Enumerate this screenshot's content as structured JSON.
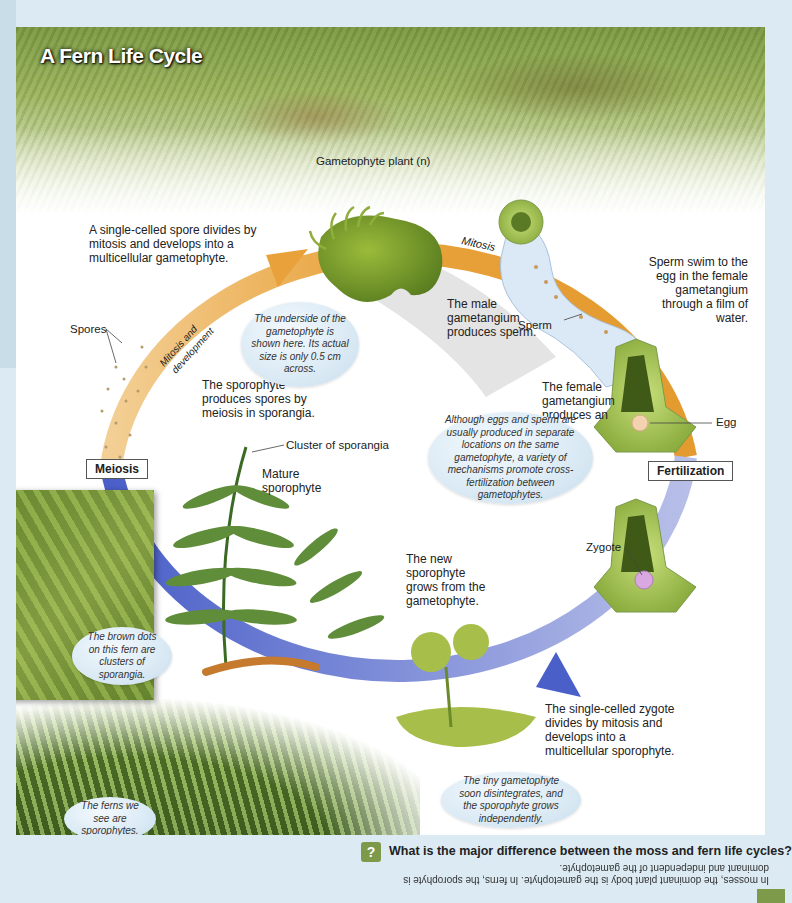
{
  "title": "A Fern Life Cycle",
  "stages": {
    "meiosis": "Meiosis",
    "fertilization": "Fertilization"
  },
  "arrows": {
    "mitosis_dev_top": "Mitosis and development",
    "mitosis": "Mitosis",
    "mitosis_dev_bottom": "Mitosis and development"
  },
  "labels": {
    "gametophyte_plant": "Gametophyte plant (n)",
    "spores": "Spores",
    "sperm": "Sperm",
    "egg": "Egg",
    "zygote": "Zygote",
    "cluster_sporangia": "Cluster of sporangia",
    "mature_sporophyte": "Mature sporophyte"
  },
  "descriptions": {
    "spore_divides": "A single-celled spore divides by mitosis and develops into a multicellular gametophyte.",
    "male_gametangium": "The male gametangium produces sperm.",
    "sperm_swim": "Sperm swim to the egg in the female gametangium through a film of water.",
    "female_gametangium": "The female gametangium produces an egg.",
    "sporophyte_produces": "The sporophyte produces spores by meiosis in sporangia.",
    "new_sporophyte": "The new sporophyte grows from the gametophyte.",
    "zygote_divides": "The single-celled zygote divides by mitosis and develops into a multicellular sporophyte."
  },
  "bubbles": {
    "underside": "The underside of the gametophyte is shown here. Its actual size is only 0.5 cm across.",
    "cross_fertilization": "Although eggs and sperm are usually produced in separate locations on the same gametophyte, a variety of mechanisms promote cross-fertilization between gametophytes.",
    "brown_dots": "The brown dots on this fern are clusters of sporangia.",
    "tiny_gametophyte": "The tiny gametophyte soon disintegrates, and the sporophyte grows independently.",
    "ferns_we_see": "The ferns we see are sporophytes."
  },
  "question": {
    "icon": "?",
    "text": "What is the major difference between the moss and fern life cycles?",
    "answer": "In mosses, the dominant plant body is the gametophyte. In ferns, the sporophyte is dominant and independent of the gametophyte."
  },
  "colors": {
    "ring_top": "#e9a23b",
    "ring_bottom": "#4a5fc8",
    "accent_green": "#7c9a4a",
    "bubble_blue": "#d6e7f3"
  }
}
